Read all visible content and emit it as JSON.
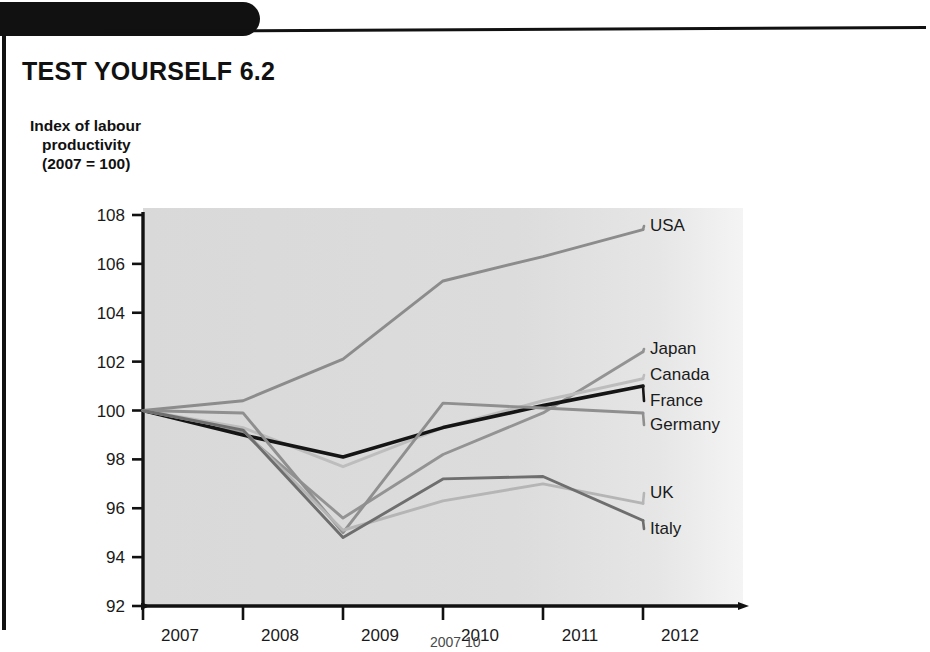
{
  "page": {
    "title": "TEST YOURSELF 6.2",
    "bottom_text_fragment": "2007 10"
  },
  "chart_data": {
    "type": "line",
    "title": "",
    "axis_caption_lines": [
      "Index of labour",
      "productivity",
      "(2007 = 100)"
    ],
    "ylabel": "Index of labour productivity (2007 = 100)",
    "xlabel": "",
    "categories": [
      "2007",
      "2008",
      "2009",
      "2010",
      "2011",
      "2012"
    ],
    "x": [
      2007,
      2008,
      2009,
      2010,
      2011,
      2012
    ],
    "ylim": [
      92,
      108
    ],
    "yticks": [
      92,
      94,
      96,
      98,
      100,
      102,
      104,
      106,
      108
    ],
    "ytick_labels": [
      "92",
      "94",
      "96",
      "98",
      "100",
      "102",
      "104",
      "106",
      "108"
    ],
    "grid": false,
    "legend": "right-endpoint-labels",
    "series": [
      {
        "name": "USA",
        "values": [
          100,
          100.4,
          102.1,
          105.3,
          106.3,
          107.4
        ],
        "color": "#8c8c8c"
      },
      {
        "name": "Japan",
        "values": [
          100,
          99.1,
          95.6,
          98.2,
          99.9,
          102.4
        ],
        "color": "#939393"
      },
      {
        "name": "Canada",
        "values": [
          100,
          99.3,
          97.7,
          99.3,
          100.4,
          101.3
        ],
        "color": "#bdbdbd"
      },
      {
        "name": "France",
        "values": [
          100,
          99.0,
          98.1,
          99.3,
          100.2,
          101.0
        ],
        "color": "#151515"
      },
      {
        "name": "Germany",
        "values": [
          100,
          99.9,
          95.0,
          100.3,
          100.1,
          99.9
        ],
        "color": "#8f8f8f"
      },
      {
        "name": "UK",
        "values": [
          100,
          99.2,
          95.1,
          96.3,
          97.0,
          96.2
        ],
        "color": "#b5b5b5"
      },
      {
        "name": "Italy",
        "values": [
          100,
          99.2,
          94.8,
          97.2,
          97.3,
          95.5
        ],
        "color": "#6e6e6e"
      }
    ]
  }
}
